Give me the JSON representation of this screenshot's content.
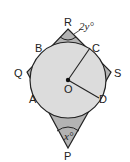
{
  "diagram": {
    "points": {
      "R": "R",
      "Q": "Q",
      "S": "S",
      "P": "P",
      "B": "B",
      "C": "C",
      "A": "A",
      "D": "D",
      "O": "O"
    },
    "angles": {
      "top": "2y°",
      "bottom": "x°"
    },
    "colors": {
      "circle_fill": "#d9d9d9",
      "shape_fill": "#b3b3b3",
      "stroke": "#222222"
    }
  }
}
